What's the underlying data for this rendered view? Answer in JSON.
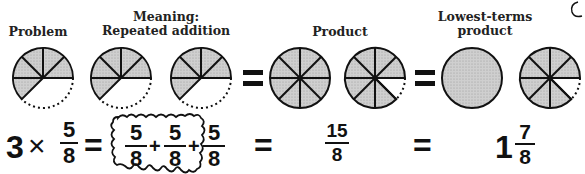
{
  "labels": {
    "problem": "Problem",
    "meaning_line1": "Meaning:",
    "meaning_line2": "Repeated addition",
    "product": "Product",
    "lowest_line1": "Lowest-terms",
    "lowest_line2": "product"
  },
  "equation": {
    "whole": "3",
    "times": "×",
    "frac": {
      "num": "5",
      "den": "8"
    },
    "eq1": "=",
    "addends": [
      {
        "num": "5",
        "den": "8"
      },
      {
        "num": "5",
        "den": "8"
      },
      {
        "num": "5",
        "den": "8"
      }
    ],
    "plus": "+",
    "eq2": "=",
    "product": {
      "num": "15",
      "den": "8"
    },
    "eq3": "=",
    "mixed_whole": "1",
    "mixed_frac": {
      "num": "7",
      "den": "8"
    }
  },
  "symbols": {
    "equals": "="
  },
  "colors": {
    "fill": "#c8c8c8",
    "stroke": "#111111"
  },
  "circles": [
    {
      "role": "problem",
      "shaded_eighths": 5
    },
    {
      "role": "addend-1",
      "shaded_eighths": 5
    },
    {
      "role": "addend-2",
      "shaded_eighths": 5
    },
    {
      "role": "product-1",
      "shaded_eighths": 8
    },
    {
      "role": "product-2",
      "shaded_eighths": 7
    },
    {
      "role": "lowest-whole",
      "shaded_eighths": 8
    },
    {
      "role": "lowest-fraction",
      "shaded_eighths": 7
    }
  ]
}
